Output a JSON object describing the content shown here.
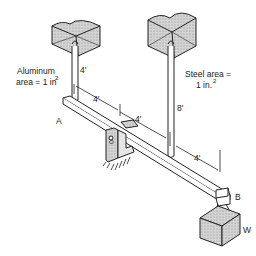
{
  "diagram": {
    "type": "mechanical-statics",
    "labels": {
      "aluminum_line1": "Aluminum",
      "aluminum_line2": "area = 1 in",
      "aluminum_sup": "2",
      "steel_line1": "Steel area =",
      "steel_line2": "1 in.",
      "steel_sup": "2",
      "aluminum_length": "4'",
      "steel_length": "8'",
      "dim_a_to_o": "4'",
      "dim_o_to_steel": "4'",
      "dim_steel_to_b": "4'",
      "point_a": "A",
      "point_b": "B",
      "pivot_o": "O",
      "weight": "W"
    },
    "colors": {
      "line": "#222222",
      "shade": "#c8c8c8",
      "background": "#ffffff"
    }
  }
}
